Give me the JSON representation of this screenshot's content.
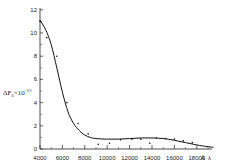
{
  "chart_data": {
    "type": "line",
    "title": "",
    "xlabel": "Å λ",
    "ylabel": "ΔF_λ ×10^-13",
    "xlim": [
      4000,
      19500
    ],
    "ylim": [
      0,
      12
    ],
    "grid": false,
    "legend": null,
    "x_ticks": [
      4000,
      6000,
      8000,
      10000,
      12000,
      14000,
      16000,
      18000
    ],
    "x_tick_labels": [
      "4000",
      "6000",
      "8000",
      "10000",
      "12000",
      "14000",
      "16000",
      "18000"
    ],
    "y_ticks": [
      0,
      2,
      4,
      6,
      8,
      10,
      12
    ],
    "y_tick_labels": [
      "0",
      "2",
      "4",
      "6",
      "8",
      "10",
      "12"
    ],
    "series": [
      {
        "name": "fitted curve",
        "style": "line",
        "x": [
          4000,
          4500,
          5000,
          5500,
          6000,
          6500,
          7000,
          7500,
          8000,
          8500,
          9000,
          10000,
          11000,
          12000,
          13000,
          14000,
          15000,
          16000,
          17000,
          18000,
          19000,
          19500
        ],
        "y": [
          11.1,
          10.3,
          9.0,
          7.0,
          4.9,
          3.2,
          2.2,
          1.6,
          1.2,
          1.0,
          0.9,
          0.85,
          0.85,
          0.9,
          0.95,
          0.95,
          0.9,
          0.75,
          0.55,
          0.35,
          0.2,
          0.15
        ]
      },
      {
        "name": "observed points",
        "style": "scatter",
        "x": [
          4000,
          4600,
          5500,
          6400,
          7400,
          8300,
          9200,
          10200,
          11200,
          12200,
          13000,
          13800,
          14400,
          15200,
          16000,
          16800,
          17600
        ],
        "y": [
          11.0,
          9.6,
          8.0,
          4.0,
          2.2,
          1.3,
          0.4,
          0.5,
          0.8,
          0.85,
          0.85,
          0.5,
          0.95,
          0.9,
          0.85,
          0.7,
          0.55
        ]
      }
    ]
  },
  "labels": {
    "y_axis_prefix": "ΔF",
    "y_axis_sub": "λ",
    "y_axis_mult": "×10",
    "y_axis_exp": "-13",
    "x_axis_unit": "Å",
    "x_axis_var": "λ"
  }
}
